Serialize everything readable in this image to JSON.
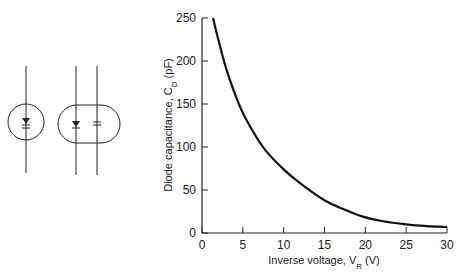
{
  "symbols": [
    {
      "name": "photodiode-symbol",
      "description": "diode in circle"
    },
    {
      "name": "photodiode-equivalent-circuit",
      "description": "diode and capacitor in parallel, enclosed in rounded outline"
    }
  ],
  "chart_data": {
    "type": "line",
    "title": "",
    "xlabel": "Inverse voltage, V",
    "xlabel_sub": "R",
    "xlabel_unit": " (V)",
    "ylabel": "Diode capacitance, C",
    "ylabel_sub": "D",
    "ylabel_unit": " (pF)",
    "xlim": [
      0,
      30
    ],
    "ylim": [
      0,
      250
    ],
    "xticks": [
      0,
      5,
      10,
      15,
      20,
      25,
      30
    ],
    "yticks": [
      0,
      50,
      100,
      150,
      200,
      250
    ],
    "grid": false,
    "legend": "none",
    "series": [
      {
        "name": "C_D vs V_R",
        "color": "#111111",
        "x": [
          1.35,
          2,
          3,
          4.65,
          6,
          7.7,
          10,
          12,
          15,
          17.5,
          19.7,
          22,
          25,
          27.5,
          30
        ],
        "y": [
          250,
          225,
          190,
          147,
          122,
          97,
          74,
          58,
          38,
          27,
          19,
          14,
          10,
          8,
          7
        ]
      }
    ]
  }
}
